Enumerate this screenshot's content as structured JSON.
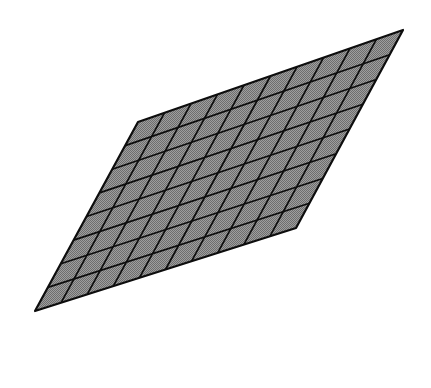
{
  "figure": {
    "title": "",
    "kind": "grid-mesh-parallelogram",
    "canvas": {
      "width": 431,
      "height": 388,
      "background": "#ffffff"
    },
    "shape": {
      "name": "parallelogram-mesh",
      "vertices": {
        "top_left": {
          "x": 138,
          "y": 122
        },
        "top_right": {
          "x": 403,
          "y": 30
        },
        "bottom_right": {
          "x": 296,
          "y": 228
        },
        "bottom_left": {
          "x": 35,
          "y": 311
        }
      },
      "grid": {
        "columns": 10,
        "rows": 8
      },
      "fill_color": "#8c8c8c",
      "fill_pattern": "dither-checker",
      "fill_pattern_light": "#9e9e9e",
      "fill_pattern_dark": "#6e6e6e",
      "line_color": "#0d0d0d",
      "outline_width": 2.2,
      "grid_line_width": 1.7
    }
  }
}
